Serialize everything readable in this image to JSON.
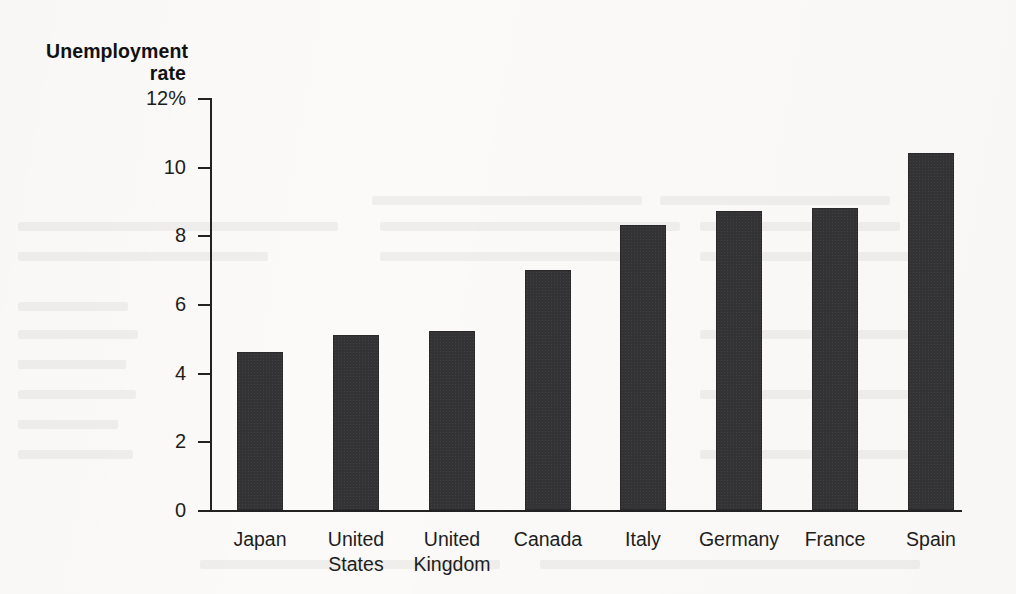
{
  "chart_data": {
    "type": "bar",
    "title": "",
    "subtitle": "",
    "xlabel": "",
    "ylabel": "Unemployment rate",
    "ylabel_lines": [
      "Unemployment",
      "rate"
    ],
    "unit": "%",
    "categories": [
      "Japan",
      "United States",
      "United Kingdom",
      "Canada",
      "Italy",
      "Germany",
      "France",
      "Spain"
    ],
    "category_lines": [
      [
        "Japan"
      ],
      [
        "United",
        "States"
      ],
      [
        "United",
        "Kingdom"
      ],
      [
        "Canada"
      ],
      [
        "Italy"
      ],
      [
        "Germany"
      ],
      [
        "France"
      ],
      [
        "Spain"
      ]
    ],
    "values": [
      4.6,
      5.1,
      5.2,
      7.0,
      8.3,
      8.7,
      8.8,
      10.4
    ],
    "ylim": [
      0,
      12
    ],
    "ytick_values": [
      0,
      2,
      4,
      6,
      8,
      10,
      12
    ],
    "ytick_labels": [
      "0",
      "2",
      "4",
      "6",
      "8",
      "10",
      "12%"
    ],
    "grid": false,
    "legend": null,
    "bar_color": "#333335",
    "axis_color": "#222222",
    "background_color": "#fbfaf8"
  }
}
